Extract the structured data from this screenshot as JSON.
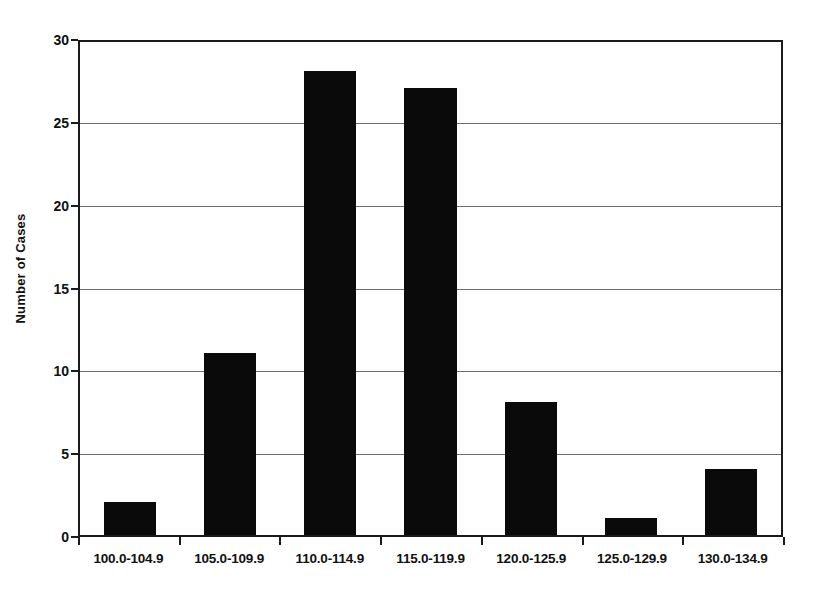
{
  "chart_data": {
    "type": "bar",
    "title": "",
    "subtitle": "",
    "xlabel": "",
    "ylabel": "Number of Cases",
    "categories": [
      "100.0-104.9",
      "105.0-109.9",
      "110.0-114.9",
      "115.0-119.9",
      "120.0-125.9",
      "125.0-129.9",
      "130.0-134.9"
    ],
    "values": [
      2,
      11,
      28,
      27,
      8,
      1,
      4
    ],
    "ylim": [
      0,
      30
    ],
    "ytick_values": [
      0,
      5,
      10,
      15,
      20,
      25,
      30
    ],
    "ytick_labels": [
      "0",
      "5",
      "10",
      "15",
      "20",
      "25",
      "30"
    ],
    "grid": "horizontal",
    "legend": "none",
    "bar_color": "#0a0a0a",
    "gridline_color": "#6e6e6e",
    "axis_color": "#1a1a1a",
    "background_color": "#ffffff",
    "annotations": []
  },
  "caption": {
    "cropped_text": ""
  }
}
